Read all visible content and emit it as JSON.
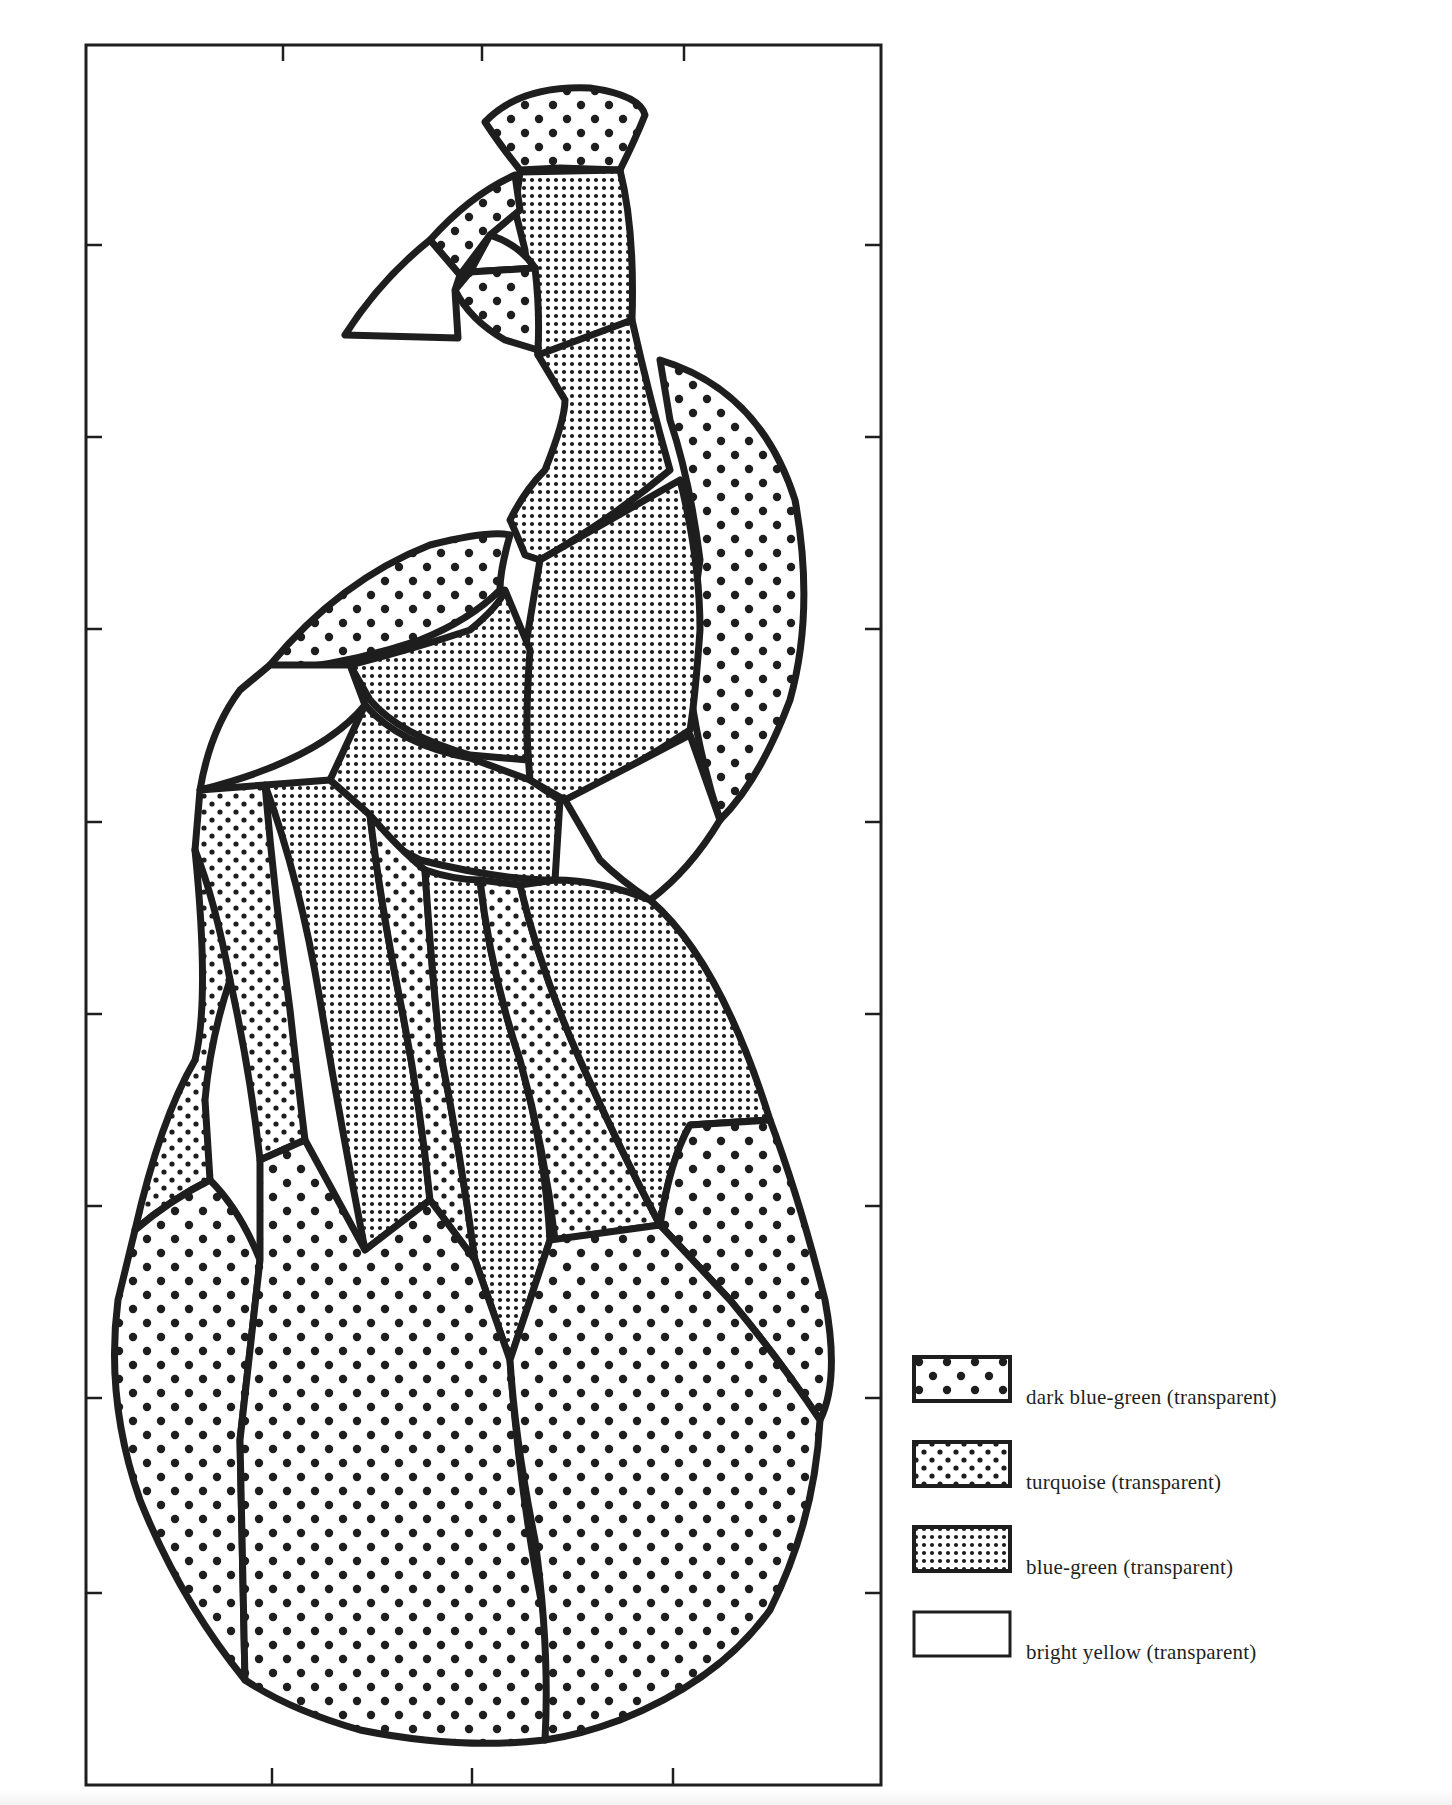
{
  "figure": {
    "frame_tick_marks": {
      "top": 3,
      "bottom": 3,
      "left": 7,
      "right": 7
    }
  },
  "legend": {
    "items": [
      {
        "label": "dark blue-green (transparent)",
        "pattern": "large-dots",
        "fill_id": "pat-dark"
      },
      {
        "label": "turquoise (transparent)",
        "pattern": "medium-dots",
        "fill_id": "pat-turq"
      },
      {
        "label": "blue-green (transparent)",
        "pattern": "fine-grid-dots",
        "fill_id": "pat-bg"
      },
      {
        "label": "bright yellow (transparent)",
        "pattern": "blank",
        "fill_id": "none"
      }
    ]
  },
  "colors": {
    "lead_line": "#1e1e1e",
    "paper": "#ffffff",
    "text": "#1f1f1f"
  }
}
